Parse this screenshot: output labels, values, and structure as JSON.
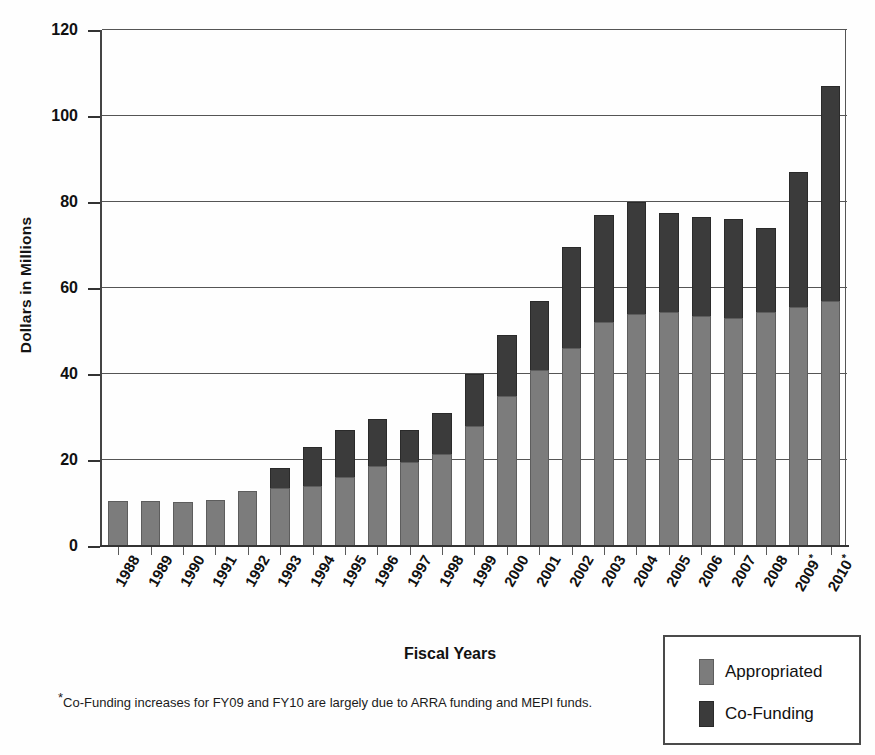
{
  "chart_data": {
    "type": "bar",
    "stacked": true,
    "title": "",
    "xlabel": "Fiscal Years",
    "ylabel": "Dollars in Millions",
    "ylim": [
      0,
      120
    ],
    "yticks": [
      0,
      20,
      40,
      60,
      80,
      100,
      120
    ],
    "grid": true,
    "legend_position": "bottom-right",
    "categories": [
      "1988",
      "1989",
      "1990",
      "1991",
      "1992",
      "1993",
      "1994",
      "1995",
      "1996",
      "1997",
      "1998",
      "1999",
      "2000",
      "2001",
      "2002",
      "2003",
      "2004",
      "2005",
      "2006",
      "2007",
      "2008",
      "2009*",
      "2010*"
    ],
    "series": [
      {
        "name": "Appropriated",
        "color": "#7c7c7c",
        "values": [
          10.5,
          10.5,
          10.2,
          10.8,
          12.7,
          13.6,
          14.0,
          16.0,
          18.5,
          19.5,
          21.5,
          28.0,
          35.0,
          41.0,
          46.0,
          52.0,
          54.0,
          54.5,
          53.5,
          53.0,
          54.5,
          55.5,
          57.0
        ]
      },
      {
        "name": "Co-Funding",
        "color": "#3b3b3b",
        "values": [
          0.0,
          0.0,
          0.0,
          0.0,
          0.0,
          4.6,
          9.0,
          11.0,
          11.0,
          7.5,
          9.5,
          12.0,
          14.0,
          16.0,
          23.5,
          25.0,
          26.0,
          23.0,
          23.0,
          23.0,
          19.5,
          31.5,
          50.0
        ]
      }
    ],
    "totals": [
      10.5,
      10.5,
      10.2,
      10.8,
      12.7,
      18.2,
      23.0,
      27.0,
      29.5,
      27.0,
      31.0,
      40.0,
      49.0,
      57.0,
      69.5,
      77.0,
      80.0,
      77.5,
      76.5,
      76.0,
      74.0,
      87.0,
      107.0
    ]
  },
  "axes": {
    "y_title": "Dollars in Millions",
    "x_title": "Fiscal Years",
    "y_tick_labels": [
      "120",
      "100",
      "80",
      "60",
      "40",
      "20",
      "0"
    ]
  },
  "legend": {
    "items": [
      {
        "label": "Appropriated",
        "color": "#7c7c7c"
      },
      {
        "label": "Co-Funding",
        "color": "#3b3b3b"
      }
    ]
  },
  "footnote": {
    "marker": "*",
    "text": "Co-Funding increases for FY09 and FY10 are largely due to ARRA funding and MEPI funds."
  }
}
